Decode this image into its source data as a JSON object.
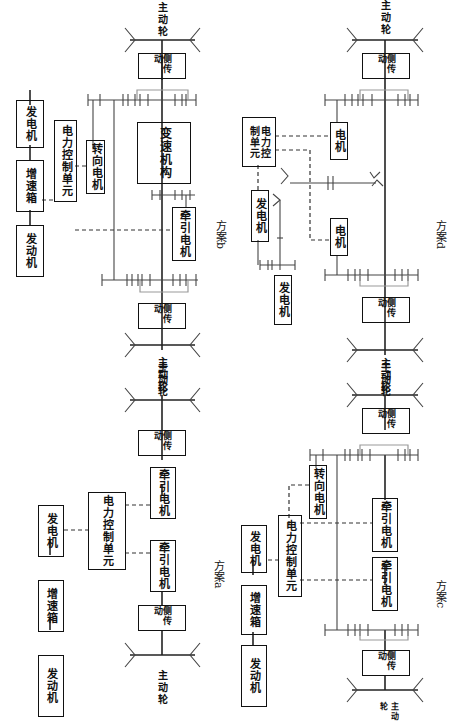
{
  "labels": {
    "engine": "发动机",
    "gearbox_up": "增速箱",
    "generator": "发电机",
    "power_control_unit": "电力控制单元",
    "power_control_unit_2line": "电力控\n制单元",
    "traction_motor": "牵引电机",
    "steering_motor": "转向电机",
    "motor": "电机",
    "transmission_mech": "变速机构",
    "side_drive": "侧传动",
    "drive_wheel": "主动轮"
  },
  "captions": {
    "a": "方案a",
    "b": "方案b",
    "c": "方案c",
    "d": "方案d"
  },
  "schemes": [
    {
      "id": "a",
      "caption": "方案a",
      "components": [
        "发动机",
        "增速箱",
        "发电机",
        "电力控制单元",
        "牵引电机",
        "牵引电机",
        "侧传动",
        "侧传动",
        "主动轮",
        "主动轮"
      ]
    },
    {
      "id": "b",
      "caption": "方案b",
      "components": [
        "发动机",
        "增速箱",
        "发电机",
        "电力控制单元",
        "转向电机",
        "牵引电机",
        "变速机构",
        "侧传动",
        "侧传动",
        "主动轮",
        "主动轮"
      ]
    },
    {
      "id": "c",
      "caption": "方案c",
      "components": [
        "发动机",
        "增速箱",
        "发电机",
        "电力控制单元",
        "转向电机",
        "牵引电机",
        "牵引电机",
        "侧传动",
        "侧传动",
        "主动轮",
        "主动轮"
      ]
    },
    {
      "id": "d",
      "caption": "方案d",
      "components": [
        "发电机",
        "发电机",
        "电力控制单元",
        "电机",
        "电机",
        "侧传动",
        "侧传动",
        "主动轮",
        "主动轮"
      ]
    }
  ]
}
